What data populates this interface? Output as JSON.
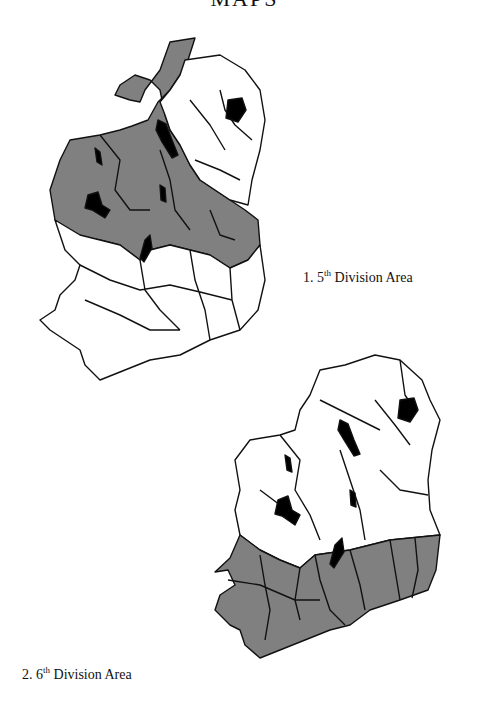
{
  "page": {
    "title": "MAPS"
  },
  "figures": [
    {
      "number": "1.",
      "ordinal": "5",
      "ordinal_suffix": "th",
      "label": "Division Area",
      "caption": "1. 5th Division Area",
      "description": "Outline map of Ireland by county; 5th Division area (north-west and midlands counties) shaded grey; lakes/loughs in black"
    },
    {
      "number": "2.",
      "ordinal": "6",
      "ordinal_suffix": "th",
      "label": "Division Area",
      "caption": "2. 6th Division Area",
      "description": "Outline map of Ireland by county; 6th Division area (southern counties) shaded grey; lakes/loughs in black"
    }
  ],
  "colors": {
    "shaded": "#808080",
    "unshaded": "#ffffff",
    "water": "#000000",
    "border": "#111111"
  }
}
